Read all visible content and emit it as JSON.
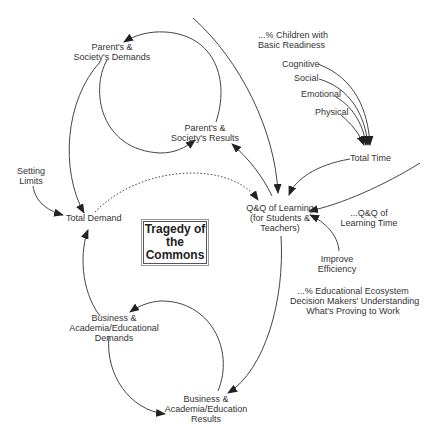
{
  "diagram": {
    "title": "Tragedy of\nthe\nCommons",
    "nodes": {
      "parents_demands": "Parent's &\nSociety's Demands",
      "parents_results": "Parent's &\nSociety's Results",
      "children_readiness": "...% Children with\nBasic Readiness",
      "cognitive": "Cognitive",
      "social": "Social",
      "emotional": "Emotional",
      "physical": "Physical",
      "total_time": "Total Time",
      "setting_limits": "Setting\nLimits",
      "total_demand": "Total Demand",
      "qq_learning": "Q&Q of Learning\n(for Students &\nTeachers)",
      "qq_learning_time": "...Q&Q of\nLearning Time",
      "improve_efficiency": "Improve\nEfficiency",
      "ecosystem_understanding": "...% Educational Ecosystem\nDecision Makers' Understanding\nWhat's Proving to Work",
      "business_demands": "Business &\nAcademia/Educational\nDemands",
      "business_results": "Business &\nAcademia/Education\nResults"
    },
    "colors": {
      "line": "#333333",
      "text": "#333333",
      "background": "#ffffff"
    }
  }
}
